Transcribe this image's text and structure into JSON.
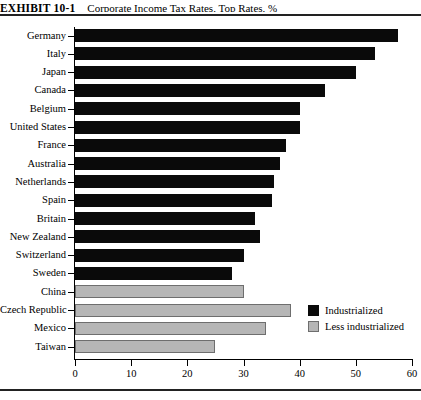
{
  "exhibit": {
    "label": "EXHIBIT 10-1",
    "title": "Corporate Income Tax Rates, Top Rates, %"
  },
  "legend": {
    "position": "inside-bottom-right",
    "items": [
      {
        "label": "Industrialized",
        "color": "#0a0a0a",
        "swatch": "black-square-icon"
      },
      {
        "label": "Less industrialized",
        "color": "#b6b6b6",
        "swatch": "gray-square-icon"
      }
    ]
  },
  "chart_data": {
    "type": "bar",
    "orientation": "horizontal",
    "title": "Corporate Income Tax Rates, Top Rates, %",
    "xlabel": "",
    "ylabel": "",
    "xlim": [
      0,
      60
    ],
    "xticks": [
      0,
      10,
      20,
      30,
      40,
      50,
      60
    ],
    "xtick_labels": [
      "0",
      "10",
      "20",
      "30",
      "40",
      "50",
      "60"
    ],
    "grid": false,
    "categories": [
      "Germany",
      "Italy",
      "Japan",
      "Canada",
      "Belgium",
      "United States",
      "France",
      "Australia",
      "Netherlands",
      "Spain",
      "Britain",
      "New Zealand",
      "Switzerland",
      "Sweden",
      "China",
      "Czech Republic",
      "Mexico",
      "Taiwan"
    ],
    "values": [
      57.5,
      53.5,
      50.0,
      44.5,
      40.0,
      40.0,
      37.5,
      36.5,
      35.5,
      35.0,
      32.0,
      33.0,
      30.0,
      28.0,
      30.0,
      38.5,
      34.0,
      25.0
    ],
    "groups": [
      "Industrialized",
      "Industrialized",
      "Industrialized",
      "Industrialized",
      "Industrialized",
      "Industrialized",
      "Industrialized",
      "Industrialized",
      "Industrialized",
      "Industrialized",
      "Industrialized",
      "Industrialized",
      "Industrialized",
      "Industrialized",
      "Less industrialized",
      "Less industrialized",
      "Less industrialized",
      "Less industrialized"
    ],
    "colors": {
      "Industrialized": "#0a0a0a",
      "Less industrialized": "#b6b6b6"
    }
  }
}
